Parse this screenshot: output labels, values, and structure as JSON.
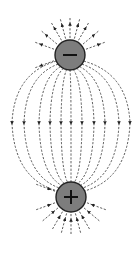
{
  "diagram": {
    "title": "Electric field lines between two opposite charges",
    "colors": {
      "background": "#ffffff",
      "charge_fill": "#7d7d7d",
      "charge_outline": "#222222",
      "sign": "#111111",
      "field_line": "#333333"
    },
    "charges": [
      {
        "id": "top",
        "sign": "negative",
        "symbol": "−",
        "cx": 70,
        "cy": 55,
        "r": 15
      },
      {
        "id": "bottom",
        "sign": "positive",
        "symbol": "+",
        "cx": 71,
        "cy": 197,
        "r": 15
      }
    ],
    "connecting_lines": {
      "count": 11,
      "mid_y": 123,
      "mid_x": [
        12,
        24,
        39,
        50,
        61,
        71,
        82,
        94,
        105,
        119,
        130
      ],
      "arrow_direction": "down"
    },
    "outer_lines_top": {
      "count": 10,
      "arrow_direction": "outward",
      "angles_deg": [
        -160,
        -140,
        -120,
        -105,
        -90,
        -75,
        -60,
        -40,
        -20,
        160
      ]
    },
    "outer_lines_bottom": {
      "count": 10,
      "arrow_direction": "inward",
      "angles_deg": [
        160,
        140,
        120,
        105,
        90,
        75,
        60,
        40,
        20,
        -160
      ]
    }
  }
}
